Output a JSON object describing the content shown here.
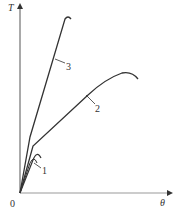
{
  "diagram": {
    "type": "torque-twist curves",
    "y_axis_label": "T",
    "x_axis_label": "θ",
    "origin_label": "0",
    "curves": [
      {
        "id": "1",
        "label": "1"
      },
      {
        "id": "2",
        "label": "2"
      },
      {
        "id": "3",
        "label": "3"
      }
    ],
    "colors": {
      "line": "#333333",
      "background": "#ffffff"
    }
  }
}
